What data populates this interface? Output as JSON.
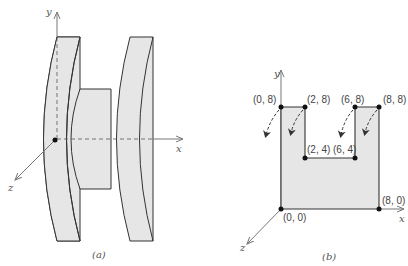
{
  "figure_a": {
    "caption": "(a)",
    "axes": {
      "x": "x",
      "y": "y",
      "z": "z"
    },
    "description": "Spool-shaped solid: two disks joined by a central hub, revolved about the y axis"
  },
  "figure_b": {
    "caption": "(b)",
    "axes": {
      "x": "x",
      "y": "y",
      "z": "z"
    },
    "points": [
      {
        "label": "(0, 8)"
      },
      {
        "label": "(2, 8)"
      },
      {
        "label": "(6, 8)"
      },
      {
        "label": "(8, 8)"
      },
      {
        "label": "(2, 4)"
      },
      {
        "label": "(6, 4)"
      },
      {
        "label": "(0, 0)"
      },
      {
        "label": "(8, 0)"
      }
    ]
  },
  "colors": {
    "fill": "#e6e6e6",
    "stroke": "#333333",
    "axis": "#777777"
  }
}
